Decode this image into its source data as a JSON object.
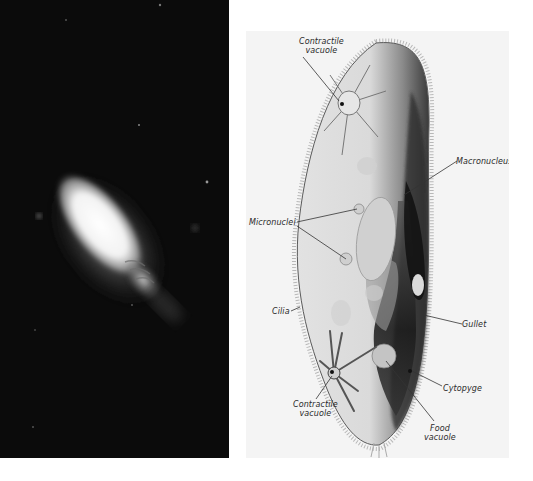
{
  "figure": {
    "photo": {
      "description": "Dark-field photomicrograph of a paramecium"
    },
    "diagram": {
      "description": "Labeled drawing of a paramecium",
      "labels": {
        "contractile_vacuole_top": [
          "Contractile",
          "vacuole"
        ],
        "macronucleus": "Macronucleus",
        "micronuclei": "Micronuclei",
        "cilia": "Cilia",
        "gullet": "Gullet",
        "cytopyge": "Cytopyge",
        "contractile_vacuole_bottom": [
          "Contractile",
          "vacuole"
        ],
        "food_vacuole": [
          "Food",
          "vacuole"
        ]
      }
    },
    "colors": {
      "photo_background": "#0b0b0b",
      "diagram_background": "#f4f4f4",
      "label_text": "#2a2a2a"
    }
  }
}
